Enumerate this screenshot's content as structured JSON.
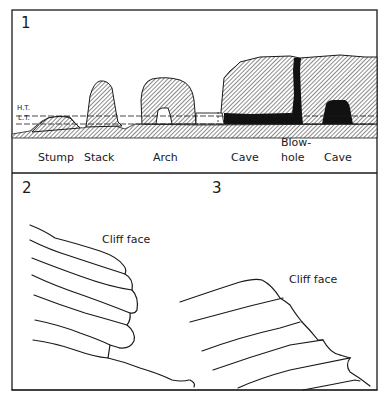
{
  "figure": {
    "panels": [
      {
        "number": "1",
        "tide_labels": {
          "high": "H.T.",
          "low": "L.T."
        },
        "features": [
          {
            "label": "Stump"
          },
          {
            "label": "Stack"
          },
          {
            "label": "Arch"
          },
          {
            "label": "Cave"
          },
          {
            "label_line1": "Blow-",
            "label_line2": "hole"
          },
          {
            "label": "Cave"
          }
        ]
      },
      {
        "number": "2",
        "label": "Cliff face"
      },
      {
        "number": "3",
        "label": "Cliff face"
      }
    ],
    "colors": {
      "ink": "#1a1a1a",
      "background": "#ffffff",
      "hatch": "#2a2a2a"
    }
  }
}
